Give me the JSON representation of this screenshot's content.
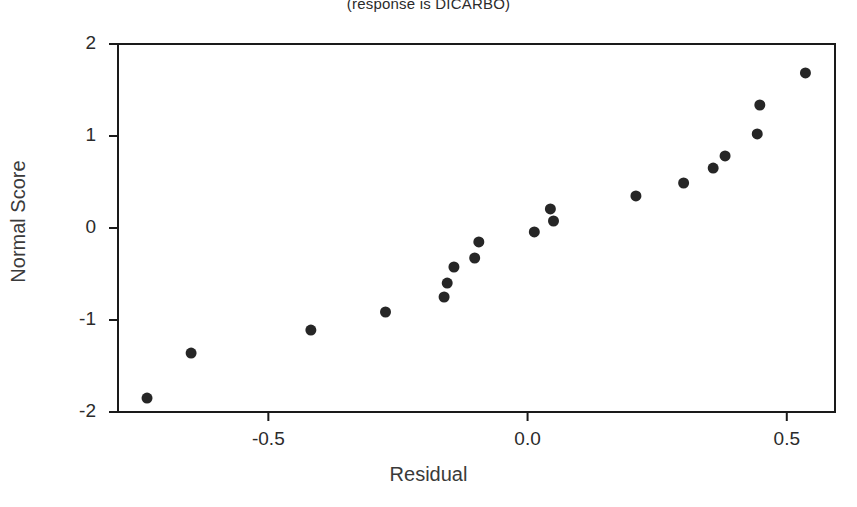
{
  "chart_data": {
    "type": "scatter",
    "title": "(response is DICARBO)",
    "xlabel": "Residual",
    "ylabel": "Normal Score",
    "xlim": [
      -0.79,
      0.593
    ],
    "ylim": [
      -2.0,
      2.0
    ],
    "xticks": [
      -0.5,
      0.0,
      0.5
    ],
    "xtick_labels": [
      "-0.5",
      "0.0",
      "0.5"
    ],
    "yticks": [
      -2,
      -1,
      0,
      1,
      2
    ],
    "ytick_labels": [
      "-2",
      "-1",
      "0",
      "1",
      "2"
    ],
    "grid": false,
    "legend": false,
    "marker": "filled-circle",
    "marker_color": "#262626",
    "marker_size_px": 11,
    "points": [
      {
        "x": -0.734,
        "y": -1.848
      },
      {
        "x": -0.649,
        "y": -1.359
      },
      {
        "x": -0.418,
        "y": -1.109
      },
      {
        "x": -0.274,
        "y": -0.913
      },
      {
        "x": -0.161,
        "y": -0.75
      },
      {
        "x": -0.155,
        "y": -0.598
      },
      {
        "x": -0.142,
        "y": -0.424
      },
      {
        "x": -0.102,
        "y": -0.326
      },
      {
        "x": -0.094,
        "y": -0.152
      },
      {
        "x": 0.013,
        "y": -0.043
      },
      {
        "x": 0.044,
        "y": 0.207
      },
      {
        "x": 0.05,
        "y": 0.076
      },
      {
        "x": 0.209,
        "y": 0.348
      },
      {
        "x": 0.301,
        "y": 0.489
      },
      {
        "x": 0.358,
        "y": 0.652
      },
      {
        "x": 0.381,
        "y": 0.783
      },
      {
        "x": 0.443,
        "y": 1.022
      },
      {
        "x": 0.448,
        "y": 1.337
      },
      {
        "x": 0.536,
        "y": 1.685
      }
    ],
    "point_count": 19
  },
  "axes": {
    "frame_color": "#1a1a1a",
    "background": "#ffffff"
  }
}
